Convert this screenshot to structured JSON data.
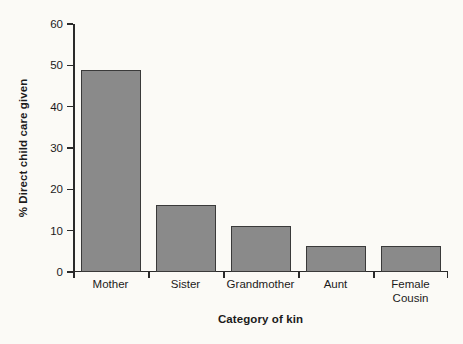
{
  "chart_data": {
    "type": "bar",
    "title": "",
    "subtitle": "",
    "xlabel": "Category of kin",
    "ylabel": "% Direct child care given",
    "categories": [
      "Mother",
      "Sister",
      "Grandmother",
      "Aunt",
      "Female Cousin"
    ],
    "category_lines": [
      [
        "Mother"
      ],
      [
        "Sister"
      ],
      [
        "Grandmother"
      ],
      [
        "Aunt"
      ],
      [
        "Female",
        "Cousin"
      ]
    ],
    "values": [
      48.8,
      16.2,
      11.1,
      6.3,
      6.2
    ],
    "ylim": [
      0,
      60
    ],
    "ytick_values": [
      0,
      10,
      20,
      30,
      40,
      50,
      60
    ],
    "ytick_labels": [
      "0",
      "10",
      "20",
      "30",
      "40",
      "50",
      "60"
    ],
    "grid": false,
    "legend": false,
    "legend_position": "none",
    "bar_color": "#8a8a8a",
    "bar_edge_color": "#3a3a3a",
    "axis_color": "#2a2a2a",
    "background_color": "#fbfaf6"
  }
}
